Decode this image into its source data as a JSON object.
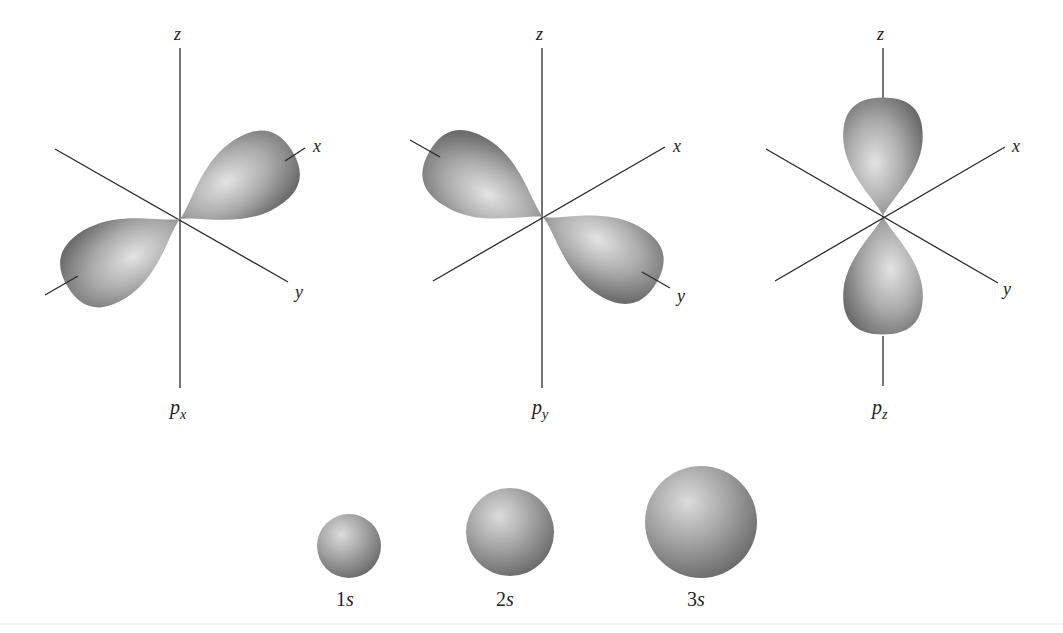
{
  "figure": {
    "colors": {
      "background": "#ffffff",
      "axis": "#2a2a2a",
      "lobe_light": "#e2e2e2",
      "lobe_dark": "#6e6e6e",
      "text": "#222222"
    }
  },
  "p_orbitals": [
    {
      "name": "px",
      "caption_main": "p",
      "caption_sub": "x",
      "axes": {
        "z": "z",
        "x": "x",
        "y": "y"
      },
      "lobe_axis": "x"
    },
    {
      "name": "py",
      "caption_main": "p",
      "caption_sub": "y",
      "axes": {
        "z": "z",
        "x": "x",
        "y": "y"
      },
      "lobe_axis": "y"
    },
    {
      "name": "pz",
      "caption_main": "p",
      "caption_sub": "z",
      "axes": {
        "z": "z",
        "x": "x",
        "y": "y"
      },
      "lobe_axis": "z"
    }
  ],
  "s_orbitals": [
    {
      "name": "1s",
      "num": "1",
      "letter": "s",
      "relative_size": 1.0
    },
    {
      "name": "2s",
      "num": "2",
      "letter": "s",
      "relative_size": 1.38
    },
    {
      "name": "3s",
      "num": "3",
      "letter": "s",
      "relative_size": 1.74
    }
  ]
}
